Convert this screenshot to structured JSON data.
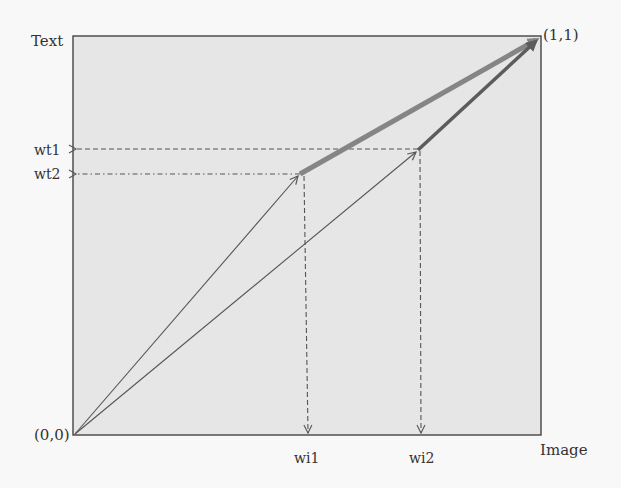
{
  "diagram": {
    "axes": {
      "y_label": "Text",
      "x_label": "Image",
      "origin_label": "(0,0)",
      "corner_label": "(1,1)"
    },
    "y_ticks": [
      {
        "label": "wt1",
        "style": "dashed"
      },
      {
        "label": "wt2",
        "style": "dash-dot"
      }
    ],
    "x_ticks": [
      {
        "label": "wi1",
        "style": "dashed"
      },
      {
        "label": "wi2",
        "style": "dashed"
      }
    ],
    "vectors": [
      {
        "name": "path-1-first-segment",
        "from": "(0,0)",
        "to": "(wi1,wt2)",
        "style": "thin"
      },
      {
        "name": "path-1-second-segment",
        "from": "(wi1,wt2)",
        "to": "(1,1)",
        "style": "thick-light"
      },
      {
        "name": "path-2-first-segment",
        "from": "(0,0)",
        "to": "(wi2,wt1)",
        "style": "thin"
      },
      {
        "name": "path-2-second-segment",
        "from": "(wi2,wt1)",
        "to": "(1,1)",
        "style": "thick-dark"
      }
    ],
    "colors": {
      "plot_fill": "#e6e6e6",
      "frame": "#444444",
      "thin_line": "#555555",
      "thick_light_arrow": "#858585",
      "thick_dark_arrow": "#5c5c5c",
      "guide_line": "#555555"
    }
  }
}
